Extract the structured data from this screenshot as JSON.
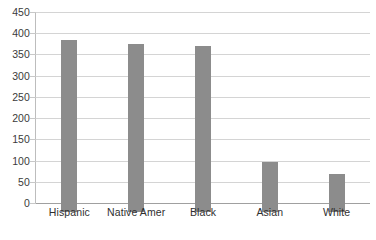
{
  "chart_data": {
    "type": "bar",
    "title": "",
    "subtitle": "",
    "xlabel": "",
    "ylabel": "",
    "categories": [
      "Hispanic",
      "Native Amer",
      "Black",
      "Asian",
      "White"
    ],
    "values": [
      405,
      397,
      390,
      118,
      90
    ],
    "series": [
      {
        "name": "Rate",
        "values": [
          405,
          397,
          390,
          118,
          90
        ]
      }
    ],
    "ylim": [
      0,
      450
    ],
    "ytick_step": 50,
    "ytick_labels": [
      "0",
      "50",
      "100",
      "150",
      "200",
      "250",
      "300",
      "350",
      "400",
      "450"
    ],
    "grid": true,
    "grid_axis": "y",
    "legend": false,
    "legend_position": "none",
    "annotations": [],
    "colors": {
      "bar": "#8c8c8c",
      "gridline": "#d4d4d4",
      "axis": "#a0a0a0",
      "text": "#333333",
      "background": "#ffffff"
    }
  }
}
